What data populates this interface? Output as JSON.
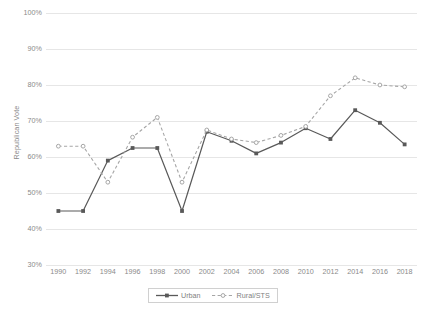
{
  "chart_data": {
    "type": "line",
    "title": "",
    "xlabel": "",
    "ylabel": "Republican Vote",
    "x": [
      1990,
      1992,
      1994,
      1996,
      1998,
      2000,
      2002,
      2004,
      2006,
      2008,
      2010,
      2012,
      2014,
      2016,
      2018
    ],
    "categories": [
      "1990",
      "1992",
      "1994",
      "1996",
      "1998",
      "2000",
      "2002",
      "2004",
      "2006",
      "2008",
      "2010",
      "2012",
      "2014",
      "2016",
      "2018"
    ],
    "ylim": [
      30,
      100
    ],
    "ytick_values": [
      30,
      40,
      50,
      60,
      70,
      80,
      90,
      100
    ],
    "ytick_labels": [
      "30%",
      "40%",
      "50%",
      "60%",
      "70%",
      "80%",
      "90%",
      "100%"
    ],
    "grid": true,
    "legend_position": "bottom",
    "series": [
      {
        "name": "Urban",
        "color": "#595959",
        "line_style": "solid",
        "marker": "square",
        "values": [
          45,
          45,
          59,
          62.5,
          62.5,
          45,
          67,
          64.5,
          61,
          64,
          68,
          65,
          73,
          69.5,
          63.5
        ]
      },
      {
        "name": "Rural/STS",
        "color": "#a6a6a6",
        "line_style": "dashed",
        "marker": "circle",
        "values": [
          63,
          63,
          53,
          65.5,
          71,
          53,
          67.5,
          65,
          64,
          66,
          68.5,
          77,
          82,
          80,
          79.5
        ]
      }
    ]
  },
  "legend": {
    "items": [
      {
        "label": "Urban"
      },
      {
        "label": "Rural/STS"
      }
    ]
  },
  "colors": {
    "gridline": "#e6e6e6",
    "text": "#8a8a8a",
    "urban": "#595959",
    "rural": "#a6a6a6",
    "background": "#ffffff"
  }
}
